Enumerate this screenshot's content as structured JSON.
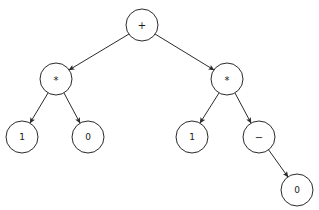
{
  "diagram": {
    "type": "binary-expression-tree",
    "background_color": "#ffffff",
    "node_fill_color": "#ffffff",
    "node_stroke_color": "#2b2b2b",
    "edge_color": "#2b2b2b",
    "node_radius": 16,
    "nodes": [
      {
        "id": "n0",
        "label": "+",
        "kind": "operator",
        "cx": 142,
        "cy": 25
      },
      {
        "id": "n1",
        "label": "*",
        "kind": "operator",
        "cx": 56,
        "cy": 79
      },
      {
        "id": "n2",
        "label": "*",
        "kind": "operator",
        "cx": 227,
        "cy": 79
      },
      {
        "id": "n3",
        "label": "1",
        "kind": "operand",
        "cx": 22,
        "cy": 137
      },
      {
        "id": "n4",
        "label": "0",
        "kind": "operand",
        "cx": 88,
        "cy": 137
      },
      {
        "id": "n5",
        "label": "1",
        "kind": "operand",
        "cx": 192,
        "cy": 137
      },
      {
        "id": "n6",
        "label": "−",
        "kind": "operator",
        "cx": 259,
        "cy": 137
      },
      {
        "id": "n7",
        "label": "0",
        "kind": "operand",
        "cx": 297,
        "cy": 190
      }
    ],
    "edges": [
      {
        "id": "e0",
        "from": "n0",
        "to": "n1",
        "x1": 129,
        "y1": 34,
        "x2": 69,
        "y2": 70,
        "arrow": true
      },
      {
        "id": "e1",
        "from": "n0",
        "to": "n2",
        "x1": 155,
        "y1": 34,
        "x2": 214,
        "y2": 70,
        "arrow": true
      },
      {
        "id": "e2",
        "from": "n1",
        "to": "n3",
        "x1": 48,
        "y1": 93,
        "x2": 30,
        "y2": 123,
        "arrow": true
      },
      {
        "id": "e3",
        "from": "n1",
        "to": "n4",
        "x1": 64,
        "y1": 93,
        "x2": 80,
        "y2": 123,
        "arrow": true
      },
      {
        "id": "e4",
        "from": "n2",
        "to": "n5",
        "x1": 219,
        "y1": 93,
        "x2": 200,
        "y2": 123,
        "arrow": true
      },
      {
        "id": "e5",
        "from": "n2",
        "to": "n6",
        "x1": 235,
        "y1": 93,
        "x2": 251,
        "y2": 123,
        "arrow": true
      },
      {
        "id": "e6",
        "from": "n6",
        "to": "n7",
        "x1": 268,
        "y1": 149,
        "x2": 288,
        "y2": 177,
        "arrow": true
      }
    ]
  }
}
